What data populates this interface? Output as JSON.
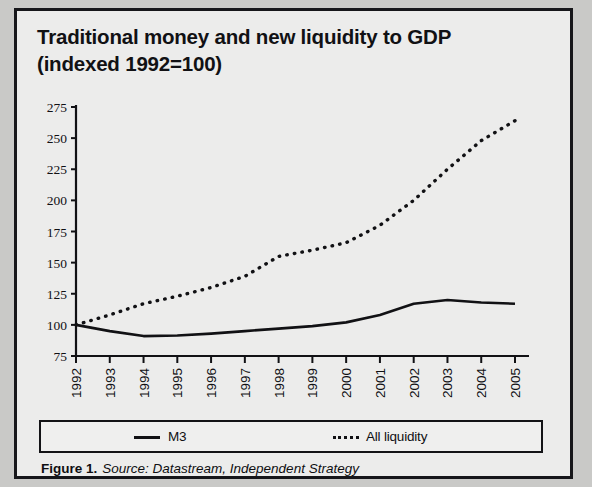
{
  "figure": {
    "title_line1": "Traditional money and new liquidity to GDP",
    "title_line2": "(indexed 1992=100)",
    "caption_label": "Figure 1.",
    "caption_source": "Source: Datastream, Independent Strategy",
    "background": "#ececeb",
    "ink": "#111114"
  },
  "legend": {
    "items": [
      {
        "label": "M3",
        "style": "solid"
      },
      {
        "label": "All liquidity",
        "style": "dotted"
      }
    ]
  },
  "chart_data": {
    "type": "line",
    "title": "Traditional money and new liquidity to GDP (indexed 1992=100)",
    "xlabel": "",
    "ylabel": "",
    "x": [
      1992,
      1993,
      1994,
      1995,
      1996,
      1997,
      1998,
      1999,
      2000,
      2001,
      2002,
      2003,
      2004,
      2005
    ],
    "categories": [
      "1992",
      "1993",
      "1994",
      "1995",
      "1996",
      "1997",
      "1998",
      "1999",
      "2000",
      "2001",
      "2002",
      "2003",
      "2004",
      "2005"
    ],
    "xlim": [
      1992,
      2005
    ],
    "ylim": [
      75,
      275
    ],
    "yticks": [
      75,
      100,
      125,
      150,
      175,
      200,
      225,
      250,
      275
    ],
    "ytick_labels": [
      "75",
      "100",
      "125",
      "150",
      "175",
      "200",
      "225",
      "250",
      "275"
    ],
    "grid": false,
    "legend_position": "bottom",
    "series": [
      {
        "name": "M3",
        "style": "solid",
        "color": "#111114",
        "values": [
          100,
          95,
          91,
          91.5,
          93,
          95,
          97,
          99,
          102,
          108,
          117,
          120,
          118,
          117
        ]
      },
      {
        "name": "All liquidity",
        "style": "dotted",
        "color": "#111114",
        "values": [
          100,
          108,
          117,
          123,
          130,
          139,
          155,
          160,
          166,
          180,
          200,
          225,
          248,
          264
        ]
      }
    ]
  }
}
